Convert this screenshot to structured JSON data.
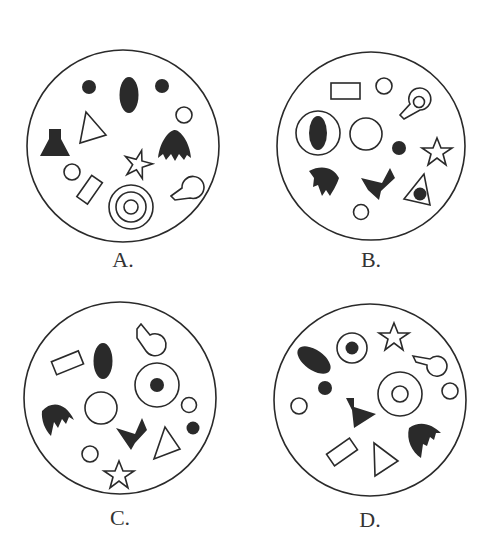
{
  "colors": {
    "stroke": "#2a2a2a",
    "fill": "#2a2a2a",
    "background": "#ffffff"
  },
  "options": [
    {
      "label": "A.",
      "cx": 123,
      "cy": 146,
      "r": 96,
      "label_x": 123,
      "label_y": 247
    },
    {
      "label": "B.",
      "cx": 371,
      "cy": 146,
      "r": 94,
      "label_x": 371,
      "label_y": 247
    },
    {
      "label": "C.",
      "cx": 120,
      "cy": 398,
      "r": 96,
      "label_x": 120,
      "label_y": 505
    },
    {
      "label": "D.",
      "cx": 370,
      "cy": 400,
      "r": 96,
      "label_x": 370,
      "label_y": 507
    }
  ]
}
